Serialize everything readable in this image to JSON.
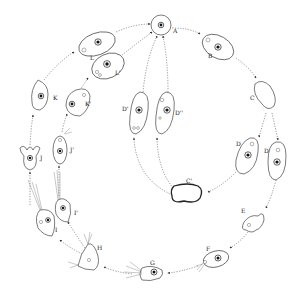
{
  "figure": {
    "type": "life-cycle diagram",
    "layout": "circular, arrows proceed clockwise from A",
    "stages": [
      {
        "id": "A",
        "label": "A",
        "form": "round cyst"
      },
      {
        "id": "B",
        "label": "B",
        "form": "oval cell with nucleus"
      },
      {
        "id": "C",
        "label": "C",
        "form": "elongated amoeboid"
      },
      {
        "id": "D1",
        "label": "D",
        "form": "oval cell with nucleus"
      },
      {
        "id": "D2",
        "label": "D",
        "form": "elongated cell with nucleus"
      },
      {
        "id": "E",
        "label": "E",
        "form": "irregular amoeboid"
      },
      {
        "id": "F",
        "label": "F",
        "form": "oval flagellate"
      },
      {
        "id": "G",
        "label": "G",
        "form": "flagellate"
      },
      {
        "id": "H",
        "label": "H",
        "form": "triangular flagellate"
      },
      {
        "id": "I",
        "label": "I",
        "form": "flagellate"
      },
      {
        "id": "I2",
        "label": "I'",
        "form": "flagellate"
      },
      {
        "id": "J",
        "label": "J",
        "form": "lobed cell"
      },
      {
        "id": "J2",
        "label": "J'",
        "form": "oval cell"
      },
      {
        "id": "K",
        "label": "K",
        "form": "pear-shaped cell"
      },
      {
        "id": "K2",
        "label": "K'",
        "form": "rounded cell"
      },
      {
        "id": "L",
        "label": "L",
        "form": "oval cell"
      },
      {
        "id": "L2",
        "label": "L'",
        "form": "oval cell"
      },
      {
        "id": "C3",
        "label": "C'",
        "form": "amoeboid cyst"
      },
      {
        "id": "D3",
        "label": "D'",
        "form": "elongated cell"
      },
      {
        "id": "D4",
        "label": "D''",
        "form": "elongated cell"
      }
    ],
    "pathways": [
      "A → B → C → D → E → F → G → H → I → J → K → L → A",
      "C → D → E (parallel D stage)",
      "D → C' → D' / D'' → A",
      "H → I' → J' → K' → L' → A"
    ],
    "colors": {
      "ink": "#222222",
      "background": "#ffffff"
    }
  },
  "labels": {
    "A": "A",
    "B": "B",
    "C": "C",
    "D1": "D",
    "D2": "D",
    "E": "E",
    "F": "F",
    "G": "G",
    "H": "H",
    "I": "I",
    "I2": "I'",
    "J": "J",
    "J2": "J'",
    "K": "K",
    "K2": "K'",
    "L": "L",
    "L2": "L'",
    "C3": "C'",
    "D3": "D'",
    "D4": "D''"
  }
}
